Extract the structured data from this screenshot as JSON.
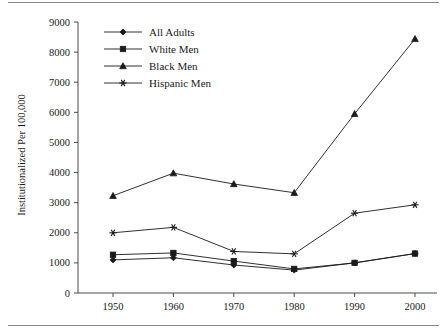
{
  "chart_data": {
    "type": "line",
    "title": "",
    "xlabel": "",
    "ylabel": "Institutionalized Per 100,000",
    "categories": [
      1950,
      1960,
      1970,
      1980,
      1990,
      2000
    ],
    "x_tick_labels": [
      "1950",
      "1960",
      "1970",
      "1980",
      "1990",
      "2000"
    ],
    "y_tick_labels": [
      "0",
      "1000",
      "2000",
      "3000",
      "4000",
      "5000",
      "6000",
      "7000",
      "8000",
      "9000"
    ],
    "y_ticks": [
      0,
      1000,
      2000,
      3000,
      4000,
      5000,
      6000,
      7000,
      8000,
      9000
    ],
    "ylim": [
      0,
      9000
    ],
    "xlim": [
      1945,
      2005
    ],
    "grid": false,
    "legend_position": "top-left",
    "series": [
      {
        "name": "All Adults",
        "marker": "diamond",
        "color": "#1a1a1a",
        "values": [
          1100,
          1170,
          930,
          760,
          1000,
          1310
        ]
      },
      {
        "name": "White Men",
        "marker": "square",
        "color": "#1a1a1a",
        "values": [
          1270,
          1330,
          1060,
          800,
          1000,
          1310
        ]
      },
      {
        "name": "Black Men",
        "marker": "triangle",
        "color": "#1a1a1a",
        "values": [
          3230,
          3980,
          3620,
          3330,
          5950,
          8440
        ]
      },
      {
        "name": "Hispanic Men",
        "marker": "star",
        "color": "#1a1a1a",
        "values": [
          2000,
          2180,
          1380,
          1300,
          2650,
          2930
        ]
      }
    ]
  },
  "figure": {
    "background_color": "#ffffff",
    "axis_color": "#4a4a4a",
    "rule_color": "#8a8a8a",
    "has_top_rule": true,
    "has_bottom_rule": true
  }
}
